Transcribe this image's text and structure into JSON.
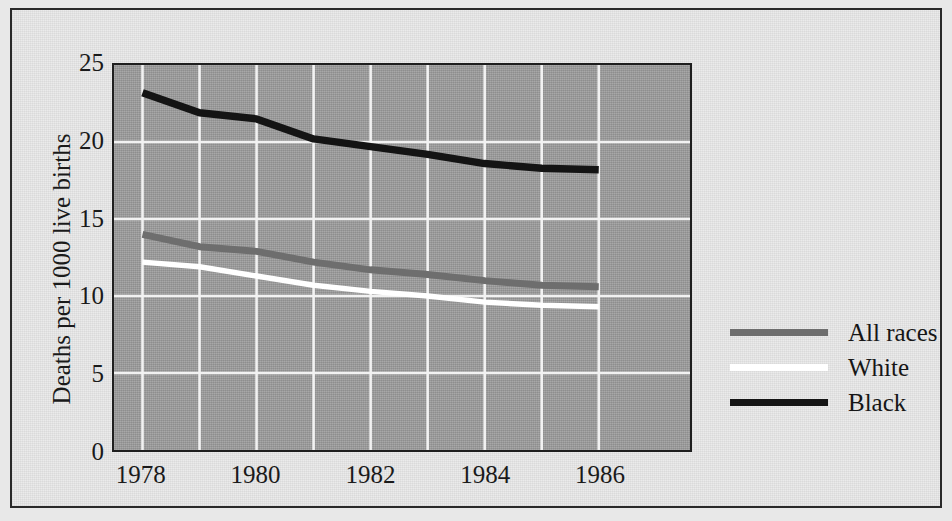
{
  "chart_data": {
    "type": "line",
    "title": "",
    "xlabel": "",
    "ylabel": "Deaths per 1000 live births",
    "x": [
      1978,
      1979,
      1980,
      1981,
      1982,
      1983,
      1984,
      1985,
      1986
    ],
    "xlim": [
      1977.5,
      1987.6
    ],
    "ylim": [
      0,
      25
    ],
    "yticks": [
      0,
      5,
      10,
      15,
      20,
      25
    ],
    "ytick_labels": [
      "0",
      "5",
      "10",
      "15",
      "20",
      "25"
    ],
    "xticks": [
      1978,
      1980,
      1982,
      1984,
      1986
    ],
    "xtick_labels": [
      "1978",
      "1980",
      "1982",
      "1984",
      "1986"
    ],
    "gridlines_x": [
      1978,
      1979,
      1980,
      1981,
      1982,
      1983,
      1984,
      1985,
      1986
    ],
    "grid": "white gridlines on gray panel, both axes",
    "legend_position": "right, outside plot, middle-lower",
    "plot_background": "#9b9b9b",
    "figure_background": "#e9e9e9",
    "series": [
      {
        "name": "All races",
        "color": "#6e6e6e",
        "values": [
          14.0,
          13.2,
          12.9,
          12.2,
          11.7,
          11.4,
          11.0,
          10.7,
          10.6
        ]
      },
      {
        "name": "White",
        "color": "#ffffff",
        "values": [
          12.2,
          11.9,
          11.3,
          10.7,
          10.3,
          10.0,
          9.6,
          9.4,
          9.3
        ]
      },
      {
        "name": "Black",
        "color": "#141414",
        "values": [
          23.2,
          21.9,
          21.5,
          20.2,
          19.7,
          19.2,
          18.6,
          18.3,
          18.2
        ]
      }
    ]
  },
  "legend": {
    "items": [
      {
        "label": "All races",
        "color": "#6e6e6e"
      },
      {
        "label": "White",
        "color": "#ffffff"
      },
      {
        "label": "Black",
        "color": "#141414"
      }
    ]
  },
  "axes": {
    "y_title": "Deaths per 1000 live births",
    "y_tick_labels": [
      "25",
      "20",
      "15",
      "10",
      "5",
      "0"
    ],
    "x_tick_labels": [
      "1978",
      "1980",
      "1982",
      "1984",
      "1986"
    ]
  }
}
